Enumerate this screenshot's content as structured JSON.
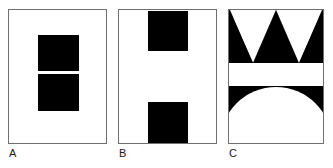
{
  "figure": {
    "background_color": "#ffffff",
    "ink_color": "#000000",
    "frame_color": "#6f6f6f",
    "width": 333,
    "height": 168,
    "panel_count": 3
  },
  "panels": [
    {
      "label": "A",
      "name": "panel-a",
      "description": "two stacked black squares centered in frame with thin white gap",
      "frame": {
        "x": 8,
        "y": 9,
        "width": 99,
        "height": 135
      },
      "shapes": [
        {
          "type": "rect",
          "name": "upper-square",
          "x": 29,
          "y": 25,
          "width": 41,
          "height": 36,
          "fill": "#000000"
        },
        {
          "type": "rect",
          "name": "lower-square",
          "x": 29,
          "y": 64,
          "width": 41,
          "height": 37,
          "fill": "#000000"
        }
      ]
    },
    {
      "label": "B",
      "name": "panel-b",
      "description": "two black squares flush to top and bottom of frame with wide white gap",
      "frame": {
        "x": 118,
        "y": 9,
        "width": 99,
        "height": 135
      },
      "shapes": [
        {
          "type": "rect",
          "name": "top-square",
          "x": 29,
          "y": 1,
          "width": 40,
          "height": 40,
          "fill": "#000000"
        },
        {
          "type": "rect",
          "name": "bottom-square",
          "x": 29,
          "y": 92,
          "width": 40,
          "height": 41,
          "fill": "#000000"
        }
      ]
    },
    {
      "label": "C",
      "name": "panel-c",
      "description": "upper black band with three up-pointing triangles, white middle band, lower black band with white semicircle",
      "frame": {
        "x": 228,
        "y": 9,
        "width": 96,
        "height": 135
      },
      "shapes": [
        {
          "type": "triangle-band",
          "name": "zigzag-band",
          "y": 0,
          "height": 53,
          "triangle_count": 3,
          "fill": "#000000"
        },
        {
          "type": "rect",
          "name": "white-band",
          "y": 53,
          "height": 23,
          "fill": "#ffffff"
        },
        {
          "type": "rect",
          "name": "lower-black-band",
          "y": 76,
          "height": 58,
          "fill": "#000000"
        },
        {
          "type": "semicircle",
          "name": "white-semicircle",
          "cx": 47,
          "cy": 134,
          "radius": 56,
          "fill": "#ffffff"
        }
      ]
    }
  ]
}
